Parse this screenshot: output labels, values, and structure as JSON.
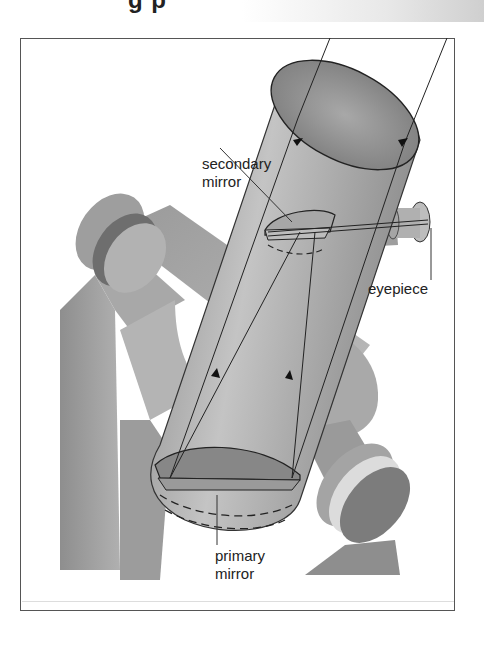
{
  "header": {
    "title_fragment": "g    p"
  },
  "diagram": {
    "labels": {
      "secondary_mirror": [
        "secondary",
        "mirror"
      ],
      "eyepiece": "eyepiece",
      "primary_mirror": [
        "primary",
        "mirror"
      ]
    },
    "colors": {
      "frame": "#555555",
      "tube_light": "#bdbdbd",
      "tube_dark": "#7a7a7a",
      "mount": "#a0a0a0",
      "lines": "#222222"
    }
  }
}
